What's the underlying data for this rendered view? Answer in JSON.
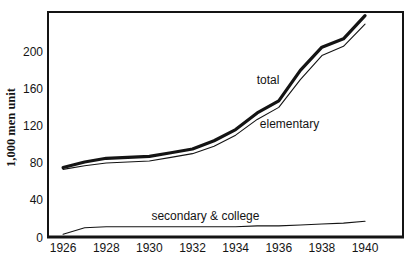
{
  "figure": {
    "background": "#ffffff",
    "line_color": "#141414",
    "text_color": "#141414"
  },
  "chart_data": {
    "type": "line",
    "title": "",
    "xlabel": "",
    "ylabel": "1,000 men unit",
    "x": [
      1926,
      1927,
      1928,
      1929,
      1930,
      1931,
      1932,
      1933,
      1934,
      1935,
      1936,
      1937,
      1938,
      1939,
      1940
    ],
    "series": [
      {
        "name": "total",
        "emphasis": "bold",
        "values": [
          75,
          81,
          85,
          86,
          87,
          91,
          95,
          104,
          116,
          134,
          147,
          180,
          205,
          214,
          239
        ]
      },
      {
        "name": "elementary",
        "emphasis": "normal",
        "values": [
          73,
          77,
          80,
          81,
          82,
          86,
          90,
          98,
          110,
          127,
          140,
          170,
          196,
          206,
          230
        ]
      },
      {
        "name": "secondary & college",
        "emphasis": "normal",
        "values": [
          3,
          10,
          11,
          11,
          11,
          11,
          11,
          11,
          11,
          12,
          12,
          13,
          14,
          15,
          17
        ]
      }
    ],
    "x_ticks": [
      "1926",
      "1928",
      "1930",
      "1932",
      "1934",
      "1936",
      "1938",
      "1940"
    ],
    "x_tick_years": [
      1926,
      1928,
      1930,
      1932,
      1934,
      1936,
      1938,
      1940
    ],
    "y_ticks": [
      0,
      40,
      80,
      120,
      160,
      200
    ],
    "xlim": [
      1925.3,
      1941.76
    ],
    "ylim": [
      0,
      243
    ],
    "grid": false,
    "legend_position": "inline-annotations",
    "annotations": [
      {
        "text": "total",
        "x": 1935.5,
        "y": 170
      },
      {
        "text": "elementary",
        "x": 1936.5,
        "y": 122
      },
      {
        "text": "secondary & college",
        "x": 1932.6,
        "y": 23
      }
    ]
  }
}
